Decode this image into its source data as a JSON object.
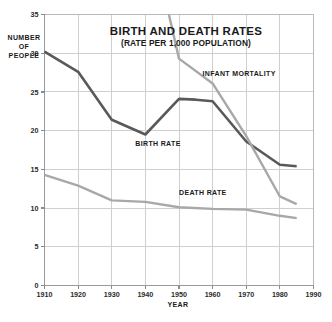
{
  "chart_data": {
    "type": "line",
    "title": "BIRTH AND DEATH RATES",
    "subtitle": "(RATE PER 1,000 POPULATION)",
    "xlabel": "YEAR",
    "ylabel": "NUMBER OF PEOPLE",
    "ylabel_lines": [
      "NUMBER",
      "OF",
      "PEOPLE"
    ],
    "xlim": [
      1910,
      1990
    ],
    "ylim": [
      0,
      35
    ],
    "x_ticks": [
      1910,
      1920,
      1930,
      1940,
      1950,
      1960,
      1970,
      1980,
      1990
    ],
    "x_tick_labels": [
      "1910",
      "1920",
      "1930",
      "1940",
      "1950",
      "1960",
      "1970",
      "1980",
      "1990"
    ],
    "y_ticks": [
      0,
      5,
      10,
      15,
      20,
      25,
      30,
      35
    ],
    "y_tick_labels": [
      "0",
      "5",
      "10",
      "15",
      "20",
      "25",
      "30",
      "35"
    ],
    "grid": true,
    "grid_x": true,
    "grid_y": true,
    "legend": "inline-annotations",
    "legend_position": "inline",
    "series": [
      {
        "name": "BIRTH RATE",
        "color": "#595959",
        "width": 2.6,
        "label_x": 1937,
        "label_y": 18.0,
        "x": [
          1910,
          1920,
          1930,
          1940,
          1950,
          1955,
          1960,
          1970,
          1980,
          1985
        ],
        "values": [
          30.2,
          27.6,
          21.4,
          19.5,
          24.1,
          24.0,
          23.8,
          18.6,
          15.6,
          15.4
        ]
      },
      {
        "name": "INFANT MORTALITY",
        "color": "#a8a8a8",
        "width": 2.4,
        "label_x": 1957,
        "label_y": 27.0,
        "x": [
          1947,
          1950,
          1960,
          1970,
          1980,
          1985
        ],
        "values": [
          35.0,
          29.3,
          26.1,
          19.3,
          11.5,
          10.5
        ]
      },
      {
        "name": "DEATH RATE",
        "color": "#a8a8a8",
        "width": 2.4,
        "label_x": 1950,
        "label_y": 11.7,
        "x": [
          1910,
          1920,
          1930,
          1940,
          1950,
          1960,
          1970,
          1980,
          1985
        ],
        "values": [
          14.3,
          12.9,
          11.0,
          10.8,
          10.1,
          9.9,
          9.8,
          9.0,
          8.7
        ]
      }
    ]
  },
  "colors": {
    "background": "#ffffff",
    "grid": "#cfcfcf",
    "frame": "#b9b9b9",
    "text": "#1a1a1a",
    "dark_series": "#595959",
    "light_series": "#a8a8a8"
  }
}
